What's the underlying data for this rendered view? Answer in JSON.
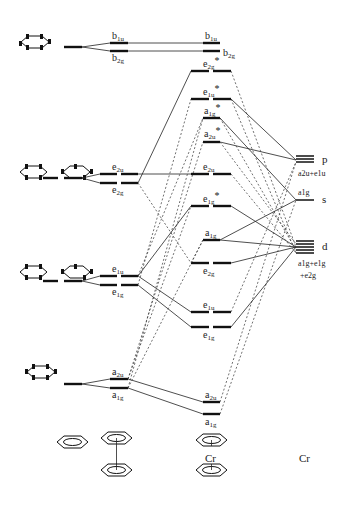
{
  "columns": {
    "ligand_fragment": "C6H6",
    "dimer_fragment": "(C6H6)2",
    "complex": "Cr(C6H6)2",
    "metal": "Cr"
  },
  "ligand_pair_levels": [
    {
      "name": "b",
      "y": 47,
      "upper": {
        "label": "b",
        "sub": "1u",
        "y": 43
      },
      "lower": {
        "label": "b",
        "sub": "2g",
        "y": 51
      }
    },
    {
      "name": "e2",
      "y": 178,
      "upper": {
        "label": "e",
        "sub": "2u",
        "y": 174
      },
      "lower": {
        "label": "e",
        "sub": "2g",
        "y": 183
      }
    },
    {
      "name": "e1",
      "y": 281,
      "upper": {
        "label": "e",
        "sub": "1u",
        "y": 276
      },
      "lower": {
        "label": "e",
        "sub": "1g",
        "y": 285
      }
    },
    {
      "name": "a",
      "y": 384,
      "upper": {
        "label": "a",
        "sub": "2u",
        "y": 379
      },
      "lower": {
        "label": "a",
        "sub": "1g",
        "y": 388
      }
    }
  ],
  "complex_levels": [
    {
      "label": "b",
      "sub": "1u",
      "star": "",
      "y": 43,
      "degenerate": false,
      "label_pos": "above"
    },
    {
      "label": "b",
      "sub": "2g",
      "star": "",
      "y": 51,
      "degenerate": false,
      "label_pos": "right"
    },
    {
      "label": "e",
      "sub": "2g",
      "star": "*",
      "y": 71,
      "degenerate": true,
      "label_pos": "above"
    },
    {
      "label": "e",
      "sub": "1u",
      "star": "*",
      "y": 99,
      "degenerate": true,
      "label_pos": "above"
    },
    {
      "label": "a",
      "sub": "1g",
      "star": "*",
      "y": 118,
      "degenerate": false,
      "label_pos": "above"
    },
    {
      "label": "a",
      "sub": "2u",
      "star": "*",
      "y": 142,
      "degenerate": false,
      "label_pos": "above"
    },
    {
      "label": "e",
      "sub": "2u",
      "star": "",
      "y": 174,
      "degenerate": true,
      "label_pos": "above"
    },
    {
      "label": "e",
      "sub": "1g",
      "star": "*",
      "y": 206,
      "degenerate": true,
      "label_pos": "above"
    },
    {
      "label": "a",
      "sub": "1g",
      "star": "",
      "y": 240,
      "degenerate": false,
      "label_pos": "above"
    },
    {
      "label": "e",
      "sub": "2g",
      "star": "",
      "y": 263,
      "degenerate": true,
      "label_pos": "below"
    },
    {
      "label": "e",
      "sub": "1u",
      "star": "",
      "y": 312,
      "degenerate": true,
      "label_pos": "above"
    },
    {
      "label": "e",
      "sub": "1g",
      "star": "",
      "y": 327,
      "degenerate": true,
      "label_pos": "below"
    },
    {
      "label": "a",
      "sub": "2u",
      "star": "",
      "y": 402,
      "degenerate": false,
      "label_pos": "above"
    },
    {
      "label": "a",
      "sub": "1g",
      "star": "",
      "y": 414,
      "degenerate": false,
      "label_pos": "below"
    }
  ],
  "metal_levels": [
    {
      "orbital": "p",
      "y": 160,
      "symmetry": "a2u+e1u"
    },
    {
      "orbital": "s",
      "y": 200,
      "symmetry": "a1g"
    },
    {
      "orbital": "d",
      "y": 247,
      "symmetry_line1": "a1g+e1g",
      "symmetry_line2": "+e2g"
    }
  ],
  "bottom_labels": {
    "complex_metal": "Cr",
    "metal": "Cr"
  }
}
